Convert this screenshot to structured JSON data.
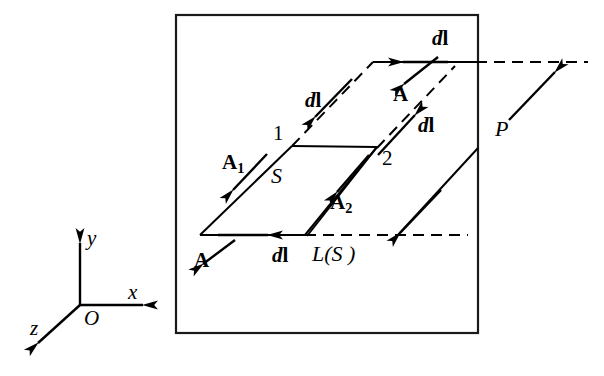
{
  "figure": {
    "type": "vector-field-diagram",
    "frame": {
      "stroke": "#1a1a1a",
      "fill": "#ffffff"
    },
    "line_color": "#000000"
  },
  "axes": {
    "origin_label": "O",
    "x_label": "x",
    "y_label": "y",
    "z_label": "z"
  },
  "labels": {
    "dl_top": {
      "d": "d",
      "l": "l"
    },
    "dl_upper_left": {
      "d": "d",
      "l": "l"
    },
    "dl_middle": {
      "d": "d",
      "l": "l"
    },
    "dl_bottom": {
      "d": "d",
      "l": "l"
    },
    "A_top": "A",
    "A_bottom": "A",
    "A1": "A",
    "A1_sub": "1",
    "A2": "A",
    "A2_sub": "2",
    "vertex_1": "1",
    "vertex_2": "2",
    "surface_S": "S",
    "boundary_L": "L(S )",
    "plane_P": "P"
  },
  "colors": {
    "ink": "#000000",
    "frame": "#1a1a1a",
    "background": "#ffffff"
  }
}
